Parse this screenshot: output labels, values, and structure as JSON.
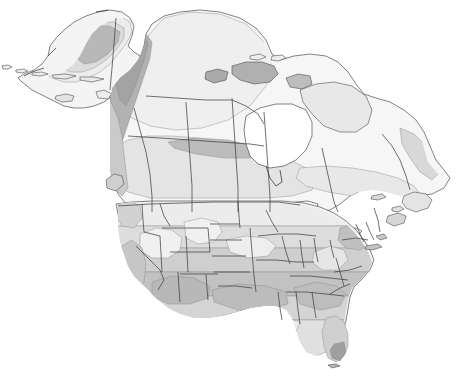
{
  "figure": {
    "kind": "thematic-map",
    "region": "North America",
    "projection_look": "conic",
    "background_color": "#ffffff",
    "outline_color": "#3b3b3b",
    "has_labels": false,
    "has_legend": false,
    "has_title": false,
    "has_axes": false,
    "has_graticule": false
  },
  "palette": {
    "zone_lightest": "#f2f2f2",
    "zone_light": "#e6e6e6",
    "zone_mid_light": "#dcdcdc",
    "zone_mid": "#cfcfcf",
    "zone_mid_dark": "#c2c2c2",
    "zone_dark": "#b5b5b5",
    "zone_darkest": "#a8a8a8",
    "water": "#ffffff",
    "border": "#3b3b3b",
    "coast": "#4d4d4d"
  },
  "zones": [
    {
      "id": "z1",
      "name": "lightest-zone",
      "fill": "#f6f6f6",
      "where": "arctic-canada-and-northern-interior"
    },
    {
      "id": "z2",
      "name": "light-zone",
      "fill": "#ececec",
      "where": "boreal-canada-and-alaska-interior"
    },
    {
      "id": "z3",
      "name": "mid-light-zone",
      "fill": "#e0e0e0",
      "where": "northern-united-states-and-southern-canada"
    },
    {
      "id": "z4",
      "name": "mid-zone",
      "fill": "#d2d2d2",
      "where": "central-united-states-band"
    },
    {
      "id": "z5",
      "name": "mid-dark-zone",
      "fill": "#c4c4c4",
      "where": "southern-united-states-band"
    },
    {
      "id": "z6",
      "name": "dark-zone",
      "fill": "#b4b4b4",
      "where": "gulf-coast-appalachians-and-alaska-range"
    },
    {
      "id": "z7",
      "name": "darkest-zone",
      "fill": "#9f9f9f",
      "where": "south-florida-yukon-highlands-arctic-islands"
    }
  ],
  "features": {
    "alaska": "alaska-peninsula-and-aleutian-chain",
    "canada": "canada-mainland-with-hudson-bay-and-arctic-archipelago",
    "united_states": "conterminous-united-states-with-state-boundaries",
    "great_lakes": "great-lakes-shown-as-white-water-bodies",
    "hudson_bay": "hudson-bay-shown-as-white-water-body",
    "newfoundland": "newfoundland-island",
    "florida": "florida-peninsula-with-darkest-tip",
    "baja": "baja-california-not-depicted"
  }
}
